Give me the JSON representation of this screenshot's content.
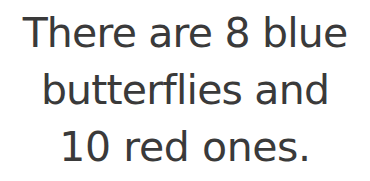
{
  "page": {
    "background_color": "#ffffff",
    "text_color": "#3a3a3a"
  },
  "text_card": {
    "full_text": "There are 8 blue butterflies and 10 red ones.",
    "alignment": "center",
    "lines": [
      {
        "text": "There are 8 blue"
      },
      {
        "text": "butterflies and"
      },
      {
        "text": "10 red ones."
      }
    ]
  }
}
